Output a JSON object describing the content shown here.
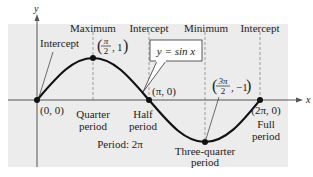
{
  "diagram": {
    "colors": {
      "panel": "#ececec",
      "curve": "#111111",
      "axis": "#555555",
      "guide": "#888888",
      "text": "#222222"
    },
    "axes": {
      "x_label": "x",
      "y_label": "y"
    },
    "curve_label": "y = sin x",
    "header_labels": [
      "Intercept",
      "Maximum",
      "Intercept",
      "Minimum",
      "Intercept"
    ],
    "points": [
      {
        "name": "origin",
        "kind": "Intercept",
        "coord": "(0, 0)",
        "period_label": ""
      },
      {
        "name": "maximum",
        "kind": "Maximum",
        "coord": "(π/2, 1)",
        "coord_num": "π",
        "coord_den": "2",
        "coord_y": "1",
        "period_label_1": "Quarter",
        "period_label_2": "period"
      },
      {
        "name": "pi",
        "kind": "Intercept",
        "coord": "(π, 0)",
        "period_label_1": "Half",
        "period_label_2": "period"
      },
      {
        "name": "minimum",
        "kind": "Minimum",
        "coord": "(3π/2, −1)",
        "coord_num": "3π",
        "coord_den": "2",
        "coord_y": "−1",
        "period_label_1": "Three-quarter",
        "period_label_2": "period"
      },
      {
        "name": "two-pi",
        "kind": "Intercept",
        "coord": "(2π, 0)",
        "period_label_1": "Full",
        "period_label_2": "period"
      }
    ],
    "period_text": "Period: 2π"
  }
}
